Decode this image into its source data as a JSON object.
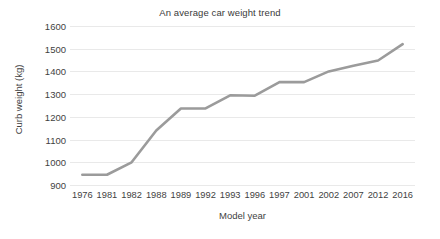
{
  "chart_data": {
    "type": "line",
    "title": "An average car weight trend",
    "xlabel": "Model year",
    "ylabel": "Curb weight (kg)",
    "categories": [
      "1976",
      "1981",
      "1982",
      "1988",
      "1989",
      "1992",
      "1993",
      "1996",
      "1997",
      "2001",
      "2002",
      "2007",
      "2012",
      "2016"
    ],
    "values": [
      945,
      945,
      1000,
      1140,
      1237,
      1237,
      1295,
      1293,
      1353,
      1353,
      1400,
      1425,
      1448,
      1520
    ],
    "series": [
      {
        "name": "Curb weight",
        "values": [
          945,
          945,
          1000,
          1140,
          1237,
          1237,
          1295,
          1293,
          1353,
          1353,
          1400,
          1425,
          1448,
          1520
        ]
      }
    ],
    "ylim": [
      900,
      1600
    ],
    "yticks": [
      900,
      1000,
      1100,
      1200,
      1300,
      1400,
      1500,
      1600
    ],
    "ytick_labels": [
      "900",
      "1000",
      "1100",
      "1200",
      "1300",
      "1400",
      "1500",
      "1600"
    ],
    "xtick_labels": [
      "1976",
      "1981",
      "1982",
      "1988",
      "1989",
      "1992",
      "1993",
      "1996",
      "1997",
      "2001",
      "2002",
      "2007",
      "2012",
      "2016"
    ],
    "grid": "horizontal",
    "legend": "none",
    "line_color": "#9b9b9b",
    "grid_color": "#e9e9e9",
    "background_color": "#ffffff",
    "text_color": "#3f3f3f",
    "markers": false,
    "line_width": 2.6
  }
}
